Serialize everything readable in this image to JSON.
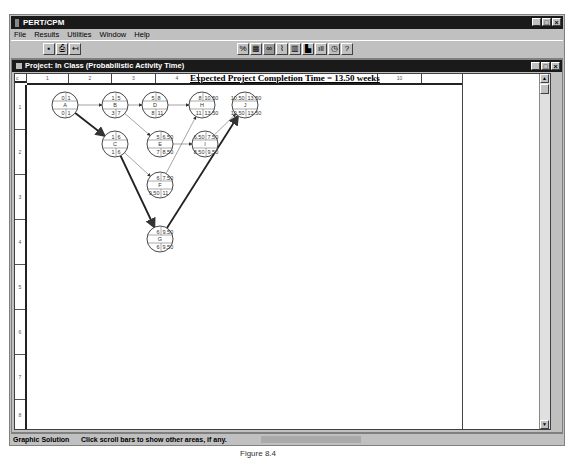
{
  "app": {
    "title": "PERT/CPM",
    "menu": [
      "File",
      "Results",
      "Utilities",
      "Window",
      "Help"
    ],
    "window_buttons": [
      "_",
      "□",
      "×"
    ]
  },
  "toolbar_left": [
    "save-icon",
    "print-icon",
    "exit-icon"
  ],
  "toolbar_right": [
    "percent-icon",
    "grid-icon",
    "network-icon",
    "graph-icon",
    "gantt-icon",
    "bar-chart-icon",
    "histogram-icon",
    "clock-icon",
    "help-icon"
  ],
  "project_window": {
    "title": "Project: In Class (Probabilistic Activity Time)",
    "headline": "Expected Project Completion Time = 13.50 weeks",
    "corner_label": "c",
    "columns": [
      "1",
      "2",
      "3",
      "4",
      "",
      "",
      "",
      "",
      "10"
    ],
    "rows": [
      "1",
      "2",
      "3",
      "4",
      "5",
      "6",
      "7",
      "8"
    ]
  },
  "network": {
    "nodes": [
      {
        "id": "A",
        "es": "0",
        "ef": "1",
        "ls": "0",
        "lf": "1",
        "x": 38,
        "y": 20
      },
      {
        "id": "B",
        "es": "1",
        "ef": "5",
        "ls": "3",
        "lf": "7",
        "x": 88,
        "y": 20
      },
      {
        "id": "D",
        "es": "5",
        "ef": "8",
        "ls": "8",
        "lf": "11",
        "x": 128,
        "y": 20
      },
      {
        "id": "H",
        "es": "8",
        "ef": "10.50",
        "ls": "11",
        "lf": "13.50",
        "x": 175,
        "y": 20
      },
      {
        "id": "J",
        "es": "10.50",
        "ef": "13.50",
        "ls": "10.50",
        "lf": "13.50",
        "x": 218,
        "y": 20
      },
      {
        "id": "C",
        "es": "1",
        "ef": "6",
        "ls": "1",
        "lf": "6",
        "x": 88,
        "y": 59
      },
      {
        "id": "E",
        "es": "5",
        "ef": "6.50",
        "ls": "7",
        "lf": "8.50",
        "x": 133,
        "y": 59
      },
      {
        "id": "I",
        "es": "6.50",
        "ef": "7.50",
        "ls": "8.50",
        "lf": "9.50",
        "x": 178,
        "y": 59
      },
      {
        "id": "F",
        "es": "6",
        "ef": "7.50",
        "ls": "9.50",
        "lf": "11",
        "x": 133,
        "y": 100
      },
      {
        "id": "G",
        "es": "6",
        "ef": "9.50",
        "ls": "6",
        "lf": "9.50",
        "x": 133,
        "y": 154
      }
    ],
    "edges": [
      {
        "from": "A",
        "to": "B",
        "critical": false
      },
      {
        "from": "A",
        "to": "C",
        "critical": true
      },
      {
        "from": "B",
        "to": "D",
        "critical": false
      },
      {
        "from": "B",
        "to": "E",
        "critical": false
      },
      {
        "from": "D",
        "to": "H",
        "critical": false
      },
      {
        "from": "C",
        "to": "F",
        "critical": false
      },
      {
        "from": "C",
        "to": "G",
        "critical": true
      },
      {
        "from": "E",
        "to": "I",
        "critical": false
      },
      {
        "from": "F",
        "to": "H",
        "critical": false
      },
      {
        "from": "I",
        "to": "J",
        "critical": false
      },
      {
        "from": "G",
        "to": "J",
        "critical": true
      }
    ]
  },
  "status": {
    "mode": "Graphic Solution",
    "hint": "Click scroll bars to show other areas, if any."
  },
  "caption": "Figure 8.4"
}
